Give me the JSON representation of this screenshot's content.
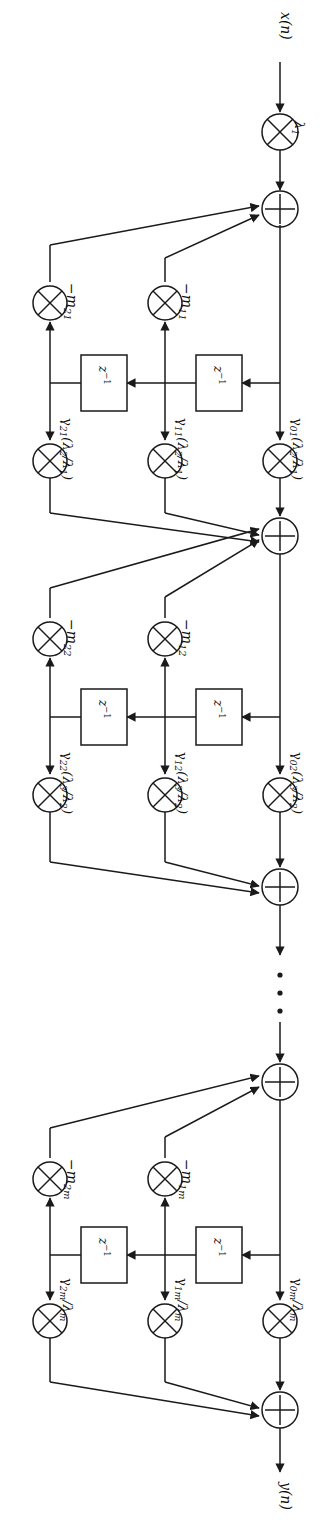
{
  "diagram": {
    "orientation": "rotated-90-cw",
    "stroke_color": "#1a1a1a",
    "fill_color": "#ffffff",
    "input_label": "x(n)",
    "output_label": "y(n)",
    "input_gain_label": "λ₁",
    "delay_label": "z⁻¹",
    "ellipsis": "⋮",
    "stages": [
      {
        "id": "stage-1",
        "feedback_labels": [
          "−m₂₁",
          "−m₁₁"
        ],
        "feedforward_labels": [
          "γ₂₁(λ₂/λ₁)",
          "γ₁₁(λ₂/λ₁)",
          "γ₀₁(λ₂/λ₁)"
        ],
        "delays": [
          "z⁻¹",
          "z⁻¹"
        ]
      },
      {
        "id": "stage-2",
        "feedback_labels": [
          "−m₂₂",
          "−m₁₂"
        ],
        "feedforward_labels": [
          "γ₂₂(λ₃/λ₂)",
          "γ₁₂(λ₃/λ₂)",
          "γ₀₂(λ₃/λ₂)"
        ],
        "delays": [
          "z⁻¹",
          "z⁻¹"
        ]
      },
      {
        "id": "stage-m",
        "feedback_labels": [
          "−m₂ₘ",
          "−m₁ₘ"
        ],
        "feedforward_labels": [
          "γ₂ₘ/λₘ",
          "γ₁ₘ/λₘ",
          "γ₀ₘ/λₘ"
        ],
        "delays": [
          "z⁻¹",
          "z⁻¹"
        ]
      }
    ],
    "node_types": {
      "multiplier": "⊗",
      "adder": "⊕"
    }
  }
}
